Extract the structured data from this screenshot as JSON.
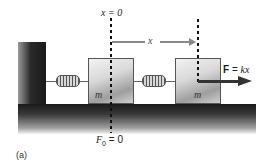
{
  "diagram": {
    "type": "spring-mass-system",
    "labels": {
      "origin": "x = 0",
      "displacement": "x",
      "force": "F = kx",
      "force_bold": "F",
      "force_rest": " = kx",
      "rest_force": "F",
      "rest_force_sub": "0",
      "rest_force_rest": " = 0",
      "mass_left": "m",
      "mass_right": "m",
      "panel": "(a)"
    },
    "colors": {
      "wall": "#1a1a1a",
      "block": "#d9d9d9",
      "dashed_line": "#111111",
      "displacement_arrow": "#888888",
      "force_arrow": "#333333"
    }
  }
}
